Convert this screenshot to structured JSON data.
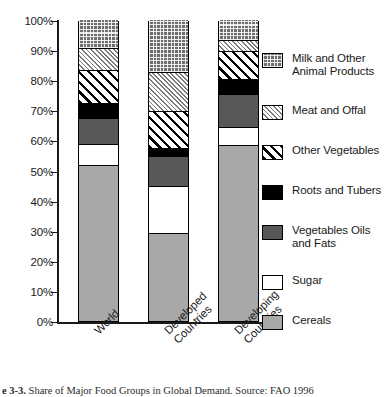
{
  "caption": {
    "figure_number": "3-3",
    "text": "Share of Major Food Groups in Global Demand. Source: FAO 1996"
  },
  "axis": {
    "y_ticks": [
      "100%",
      "90%",
      "80%",
      "70%",
      "60%",
      "50%",
      "40%",
      "30%",
      "20%",
      "10%",
      "0%"
    ],
    "y_values": [
      100,
      90,
      80,
      70,
      60,
      50,
      40,
      30,
      20,
      10,
      0
    ]
  },
  "legend": {
    "items": [
      {
        "label": "Milk and Other\nAnimal Products",
        "key": "milk",
        "swatch": "checkered-dark-swatch"
      },
      {
        "label": "Meat and Offal",
        "key": "meat",
        "swatch": "fine-hatch-swatch"
      },
      {
        "label": "Other Vegetables",
        "key": "other_vegetables",
        "swatch": "diagonal-stripe-swatch"
      },
      {
        "label": "Roots and Tubers",
        "key": "roots",
        "swatch": "solid-black-swatch"
      },
      {
        "label": "Vegetables Oils\nand Fats",
        "key": "vegetable_oils",
        "swatch": "dark-gray-swatch"
      },
      {
        "label": "Sugar",
        "key": "sugar",
        "swatch": "white-swatch"
      },
      {
        "label": "Cereals",
        "key": "cereals",
        "swatch": "medium-gray-swatch"
      }
    ]
  },
  "chart_data": {
    "type": "bar",
    "stacked": true,
    "title": "Share of Major Food Groups in Global Demand",
    "xlabel": "",
    "ylabel": "",
    "ylim": [
      0,
      100
    ],
    "ytick_labels": [
      "0%",
      "10%",
      "20%",
      "30%",
      "40%",
      "50%",
      "60%",
      "70%",
      "80%",
      "90%",
      "100%"
    ],
    "grid": false,
    "legend_position": "right",
    "categories": [
      "World",
      "Developed\nCountries",
      "Developing\nCountries"
    ],
    "series": [
      {
        "name": "Cereals",
        "values": [
          51.5,
          29.0,
          58.0
        ]
      },
      {
        "name": "Sugar",
        "values": [
          7.0,
          15.5,
          6.0
        ]
      },
      {
        "name": "Vegetables Oils and Fats",
        "values": [
          8.5,
          10.0,
          11.0
        ]
      },
      {
        "name": "Roots and Tubers",
        "values": [
          5.0,
          2.5,
          5.0
        ]
      },
      {
        "name": "Other Vegetables",
        "values": [
          11.0,
          12.5,
          9.5
        ]
      },
      {
        "name": "Meat and Offal",
        "values": [
          7.5,
          13.0,
          3.5
        ]
      },
      {
        "name": "Milk and Other Animal Products",
        "values": [
          9.5,
          17.5,
          7.0
        ]
      }
    ],
    "colors": {
      "cereals": "#a8a8a8",
      "sugar": "#ffffff",
      "vegetable_oils": "#585858",
      "roots": "#000000",
      "other_vegetables": "#ffffff",
      "meat": "#ffffff",
      "milk": "#6e6e6e",
      "outline": "#000000"
    }
  }
}
